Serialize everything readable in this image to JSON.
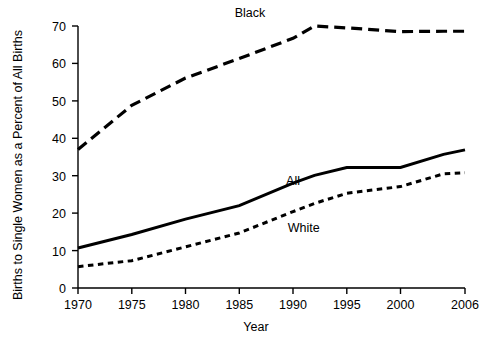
{
  "chart_data": {
    "type": "line",
    "title": "",
    "xlabel": "Year",
    "ylabel": "Births to Single Women as a Percent of All Births",
    "xlim": [
      1970,
      2006
    ],
    "ylim": [
      0,
      70
    ],
    "xticks": [
      1970,
      1975,
      1980,
      1985,
      1990,
      1995,
      2000,
      2006
    ],
    "xtick_labels": [
      "1970",
      "1975",
      "1980",
      "1985",
      "1990",
      "1995",
      "2000",
      "2006"
    ],
    "yticks": [
      0,
      10,
      20,
      30,
      40,
      50,
      60,
      70
    ],
    "ytick_labels": [
      "0",
      "10",
      "20",
      "30",
      "40",
      "50",
      "60",
      "70"
    ],
    "grid": false,
    "legend_position": "inline-labels",
    "x": [
      1970,
      1975,
      1980,
      1985,
      1990,
      1992,
      1995,
      2000,
      2004,
      2006
    ],
    "series": [
      {
        "name": "Black",
        "label": "Black",
        "line_style": "long-dashed",
        "values": [
          37.0,
          48.8,
          56.1,
          61.3,
          66.7,
          70.0,
          69.5,
          68.5,
          68.6,
          68.6
        ]
      },
      {
        "name": "All",
        "label": "All",
        "line_style": "solid",
        "values": [
          10.7,
          14.3,
          18.4,
          22.0,
          28.0,
          30.1,
          32.2,
          32.2,
          35.7,
          36.9
        ]
      },
      {
        "name": "White",
        "label": "White",
        "line_style": "dotted",
        "values": [
          5.7,
          7.3,
          11.0,
          14.7,
          20.4,
          22.6,
          25.3,
          27.1,
          30.5,
          30.8
        ]
      }
    ],
    "annotations": [
      {
        "text": "Black",
        "x": 1986,
        "y": 72.5
      },
      {
        "text": "All",
        "x": 1990,
        "y": 27.5
      },
      {
        "text": "White",
        "x": 1991,
        "y": 15.0
      }
    ]
  }
}
